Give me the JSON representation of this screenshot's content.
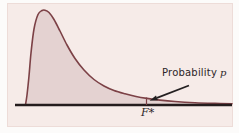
{
  "figure": {
    "panel_color": "#f6ebe8",
    "page_background": "#fcfbfa",
    "curve_color": "#7c4146",
    "area_fill_color": "#e4d2d1",
    "axis_color": "#241c1d",
    "arrow_color": "#242021",
    "text_color": "#2b2526",
    "annotation": {
      "text": "Probability",
      "variable": "p"
    },
    "x_axis": {
      "tick_label": "F*"
    }
  },
  "chart_data": {
    "type": "area",
    "title": "",
    "xlabel": "",
    "ylabel": "",
    "x_tick_labels": [
      "F*"
    ],
    "legend": [],
    "grid": false,
    "annotations": [
      {
        "text": "Probability p",
        "points_to": "right-tail area beyond F*"
      }
    ],
    "axis_y_px": 105,
    "axis_x_range_px": [
      15,
      232
    ],
    "f_star_x_px": 146.5,
    "f_star_tick_top_px": 97.5,
    "arrow_px": {
      "from": [
        189,
        85.5
      ],
      "to": [
        149.5,
        100.8
      ]
    },
    "curve_points_px": [
      [
        25.5,
        104.8
      ],
      [
        27,
        95
      ],
      [
        29,
        76
      ],
      [
        31,
        53
      ],
      [
        34,
        29
      ],
      [
        38,
        14.5
      ],
      [
        42,
        10.5
      ],
      [
        45,
        10.2
      ],
      [
        49,
        12.5
      ],
      [
        54,
        19.5
      ],
      [
        60,
        31
      ],
      [
        67,
        45
      ],
      [
        75,
        58.5
      ],
      [
        84,
        70
      ],
      [
        94,
        79.5
      ],
      [
        104,
        86
      ],
      [
        114,
        90.5
      ],
      [
        125,
        93.8
      ],
      [
        136,
        96.5
      ],
      [
        147,
        98.4
      ],
      [
        160,
        100.1
      ],
      [
        175,
        101.5
      ],
      [
        195,
        102.7
      ],
      [
        215,
        103.4
      ],
      [
        232,
        103.8
      ]
    ]
  }
}
